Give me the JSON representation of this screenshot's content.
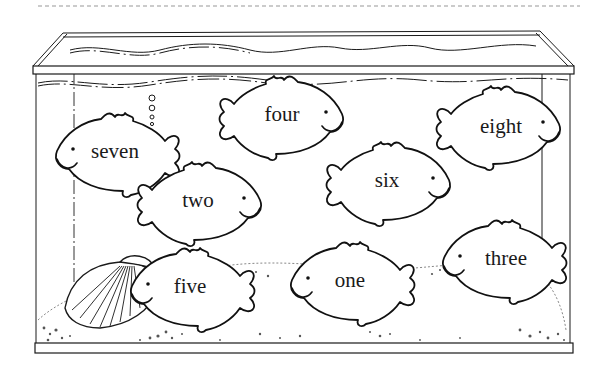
{
  "worksheet": {
    "scene": "fish-tank",
    "fish": [
      {
        "id": "seven",
        "label": "seven",
        "facing": "left"
      },
      {
        "id": "four",
        "label": "four",
        "facing": "right"
      },
      {
        "id": "eight",
        "label": "eight",
        "facing": "right"
      },
      {
        "id": "two",
        "label": "two",
        "facing": "right"
      },
      {
        "id": "six",
        "label": "six",
        "facing": "right"
      },
      {
        "id": "five",
        "label": "five",
        "facing": "left"
      },
      {
        "id": "one",
        "label": "one",
        "facing": "left"
      },
      {
        "id": "three",
        "label": "three",
        "facing": "left"
      }
    ],
    "colors": {
      "ink": "#1a1a1a",
      "paper": "#ffffff"
    }
  }
}
